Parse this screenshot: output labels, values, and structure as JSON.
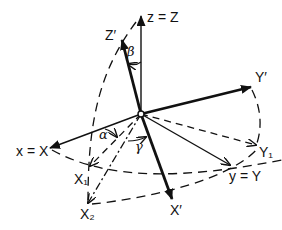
{
  "diagram": {
    "type": "Euler angle rotation (coordinate frame rotation)",
    "origin": [
      141,
      114
    ],
    "axes": [
      {
        "id": "z",
        "label": "z = Z",
        "tip": [
          141,
          16
        ],
        "style": "thin-solid",
        "label_pos": [
          148,
          22
        ]
      },
      {
        "id": "Zprime",
        "label": "Z′",
        "tip": [
          122,
          40
        ],
        "style": "thick-solid",
        "label_pos": [
          105,
          38
        ]
      },
      {
        "id": "Yprime",
        "label": "Y′",
        "tip": [
          251,
          87
        ],
        "style": "thick-solid",
        "label_pos": [
          255,
          82
        ]
      },
      {
        "id": "x",
        "label": "x = X",
        "tip": [
          50,
          148
        ],
        "style": "thin-solid",
        "label_pos": [
          16,
          157
        ]
      },
      {
        "id": "X1",
        "label": "X₁",
        "tip": [
          90,
          166
        ],
        "style": "dashed",
        "label_pos": [
          75,
          184
        ]
      },
      {
        "id": "X2",
        "label": "X₂",
        "tip": [
          88,
          203
        ],
        "style": "dash-dot",
        "label_pos": [
          80,
          218
        ]
      },
      {
        "id": "Xprime",
        "label": "X′",
        "tip": [
          172,
          199
        ],
        "style": "thick-solid",
        "label_pos": [
          170,
          215
        ]
      },
      {
        "id": "Y1",
        "label": "Y₁",
        "tip": [
          256,
          145
        ],
        "style": "dashed",
        "label_pos": [
          259,
          157
        ]
      },
      {
        "id": "y",
        "label": "y = Y",
        "tip": [
          230,
          165
        ],
        "style": "thin-solid",
        "label_pos": [
          230,
          181
        ]
      }
    ],
    "angles": [
      {
        "symbol": "β",
        "label_pos": [
          128,
          56
        ]
      },
      {
        "symbol": "α",
        "label_pos": [
          100,
          138
        ]
      },
      {
        "symbol": "γ",
        "label_pos": [
          136,
          149
        ]
      }
    ]
  }
}
